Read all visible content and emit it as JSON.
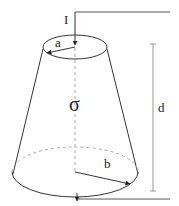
{
  "diagram": {
    "labels": {
      "current": "I",
      "top_radius": "a",
      "bottom_radius": "b",
      "conductivity": "σ",
      "height": "d"
    },
    "colors": {
      "stroke": "#333333",
      "dimension_line": "#999999",
      "dashed": "#aaaaaa",
      "text": "#222222"
    }
  }
}
